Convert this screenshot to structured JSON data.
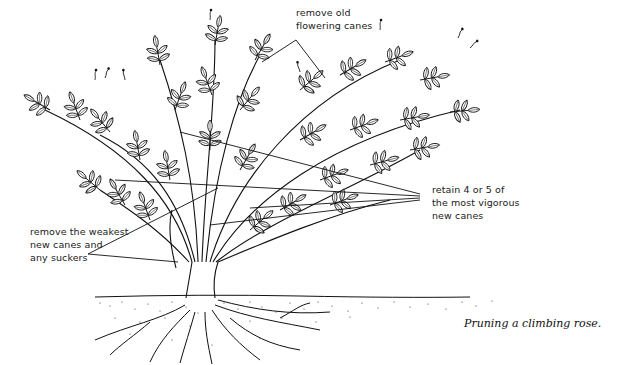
{
  "figure": {
    "caption": "Pruning a climbing rose.",
    "labels": {
      "old_canes": {
        "line1": "remove old",
        "line2": "flowering canes"
      },
      "retain": {
        "line1": "retain 4 or 5 of",
        "line2": "the most vigorous",
        "line3": "new canes"
      },
      "weakest": {
        "line1": "remove the weakest",
        "line2": "new canes and",
        "line3": "any suckers"
      }
    },
    "colors": {
      "ink": "#111111",
      "background": "#ffffff"
    }
  }
}
